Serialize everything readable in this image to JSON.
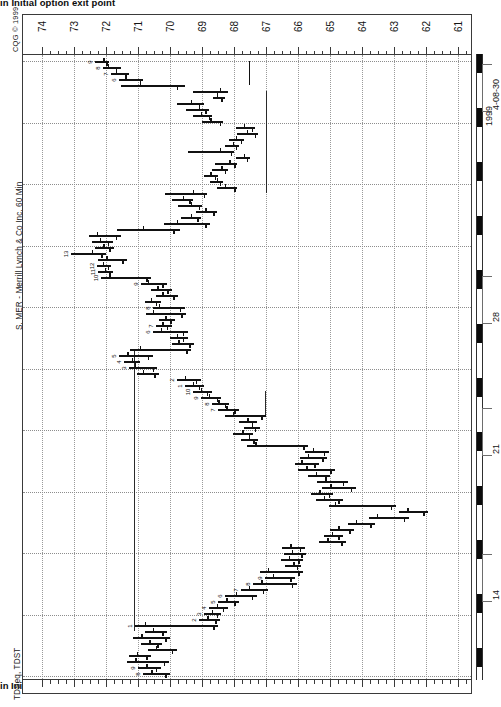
{
  "document": {
    "title_clipped": "in Initial option exit point",
    "title_clipped_bottom": "in Initial option exit point"
  },
  "chart_meta": {
    "copyright": "CQG © 1999",
    "symbol_caption": "S, MER - Merrill Lynch & Co Inc, 60 Min",
    "study_caption": "TDSeq, TDST",
    "vendor": "CQG",
    "interval": "60 Min",
    "symbol": "MER",
    "company": "Merrill Lynch & Co Inc",
    "orientation": "rotated-90-clockwise",
    "ink_color": "#111111",
    "grid_color": "#8d8d8d",
    "frame_color": "#3a3a3a"
  },
  "chart_data": {
    "type": "bar",
    "subtype": "ohlc-bar-rotated",
    "title": "S, MER - Merrill Lynch & Co Inc, 60 Min",
    "xlabel": "Price",
    "ylabel": "Time",
    "grid": true,
    "legend": "none",
    "price_axis": {
      "orientation": "horizontal-top",
      "direction": "descending-left-to-right",
      "ticks": [
        74,
        73,
        72,
        71,
        70,
        69,
        68,
        67,
        66,
        65,
        64,
        63,
        62,
        61
      ],
      "minor_divisions_per_major": 4,
      "xlim": [
        74.6,
        60.6
      ]
    },
    "time_axis": {
      "orientation": "vertical-right",
      "direction": "newest-at-top",
      "end_label": "4-08-30",
      "year_label": "1999",
      "tick_labels": [
        "4-08-30",
        "1999",
        "28",
        "21",
        "14"
      ],
      "session_shading": "alternating-black-white-day-blocks"
    },
    "annotations": {
      "tdst_lines": [
        {
          "name": "tdst-resistance-upper",
          "price": 67.0,
          "label": "TDST"
        },
        {
          "name": "tdst-support-mid",
          "price": 71.1,
          "label": "TDST"
        },
        {
          "name": "tdst-resistance-lower",
          "price": 67.05,
          "label": "TDST"
        }
      ],
      "td_sequential_counts": [
        "9",
        "8",
        "7",
        "6",
        "9",
        "8",
        "7",
        "6",
        "5",
        "4",
        "3",
        "2",
        "1",
        "9",
        "8",
        "7",
        "6",
        "5",
        "4",
        "3",
        "2",
        "1",
        "9",
        "8",
        "7",
        "6"
      ]
    },
    "bars": [
      {
        "t": 0,
        "o": 72.1,
        "h": 72.35,
        "l": 71.9,
        "c": 72.0,
        "num": "9"
      },
      {
        "t": 1,
        "o": 71.95,
        "h": 72.1,
        "l": 71.55,
        "c": 71.7,
        "num": "8"
      },
      {
        "t": 2,
        "o": 71.7,
        "h": 71.85,
        "l": 71.3,
        "c": 71.4,
        "num": "7"
      },
      {
        "t": 3,
        "o": 71.4,
        "h": 71.6,
        "l": 70.85,
        "c": 70.95,
        "num": "6"
      },
      {
        "t": 4,
        "o": 70.95,
        "h": 71.55,
        "l": 69.55,
        "c": 69.8,
        "num": ""
      },
      {
        "t": 5,
        "o": 68.45,
        "h": 69.3,
        "l": 68.2,
        "c": 68.55,
        "num": ""
      },
      {
        "t": 6,
        "o": 68.55,
        "h": 68.65,
        "l": 68.3,
        "c": 68.4,
        "num": ""
      },
      {
        "t": 7,
        "o": 69.35,
        "h": 69.8,
        "l": 68.95,
        "c": 69.1,
        "num": ""
      },
      {
        "t": 8,
        "o": 69.1,
        "h": 69.5,
        "l": 68.8,
        "c": 68.9,
        "num": ""
      },
      {
        "t": 9,
        "o": 69.05,
        "h": 69.3,
        "l": 68.7,
        "c": 68.8,
        "num": ""
      },
      {
        "t": 10,
        "o": 68.75,
        "h": 69.0,
        "l": 68.35,
        "c": 68.45,
        "num": ""
      },
      {
        "t": 11,
        "o": 67.7,
        "h": 67.95,
        "l": 67.35,
        "c": 67.45,
        "num": ""
      },
      {
        "t": 12,
        "o": 67.6,
        "h": 67.9,
        "l": 67.25,
        "c": 67.35,
        "num": ""
      },
      {
        "t": 13,
        "o": 67.95,
        "h": 68.15,
        "l": 67.7,
        "c": 67.8,
        "num": ""
      },
      {
        "t": 14,
        "o": 68.05,
        "h": 68.3,
        "l": 67.85,
        "c": 67.95,
        "num": ""
      },
      {
        "t": 15,
        "o": 68.45,
        "h": 69.45,
        "l": 68.0,
        "c": 68.1,
        "num": ""
      },
      {
        "t": 16,
        "o": 67.7,
        "h": 67.95,
        "l": 67.5,
        "c": 67.6,
        "num": ""
      },
      {
        "t": 17,
        "o": 68.15,
        "h": 68.6,
        "l": 67.9,
        "c": 68.0,
        "num": ""
      },
      {
        "t": 18,
        "o": 68.4,
        "h": 68.7,
        "l": 68.2,
        "c": 68.3,
        "num": ""
      },
      {
        "t": 19,
        "o": 68.75,
        "h": 68.95,
        "l": 68.5,
        "c": 68.6,
        "num": ""
      },
      {
        "t": 20,
        "o": 68.55,
        "h": 68.75,
        "l": 68.35,
        "c": 68.45,
        "num": ""
      },
      {
        "t": 21,
        "o": 68.3,
        "h": 68.55,
        "l": 67.9,
        "c": 68.0,
        "num": ""
      },
      {
        "t": 22,
        "o": 69.3,
        "h": 70.15,
        "l": 68.85,
        "c": 68.95,
        "num": ""
      },
      {
        "t": 23,
        "o": 69.6,
        "h": 69.95,
        "l": 69.3,
        "c": 69.4,
        "num": ""
      },
      {
        "t": 24,
        "o": 69.35,
        "h": 69.75,
        "l": 69.0,
        "c": 69.1,
        "num": ""
      },
      {
        "t": 25,
        "o": 68.9,
        "h": 69.2,
        "l": 68.55,
        "c": 68.65,
        "num": ""
      },
      {
        "t": 26,
        "o": 69.35,
        "h": 69.65,
        "l": 69.05,
        "c": 69.15,
        "num": ""
      },
      {
        "t": 27,
        "o": 69.8,
        "h": 70.2,
        "l": 68.75,
        "c": 68.9,
        "num": ""
      },
      {
        "t": 28,
        "o": 70.85,
        "h": 71.65,
        "l": 69.7,
        "c": 69.9,
        "num": ""
      },
      {
        "t": 29,
        "o": 72.3,
        "h": 72.55,
        "l": 71.55,
        "c": 71.7,
        "num": ""
      },
      {
        "t": 30,
        "o": 72.2,
        "h": 72.45,
        "l": 71.8,
        "c": 71.95,
        "num": ""
      },
      {
        "t": 31,
        "o": 72.1,
        "h": 72.35,
        "l": 71.75,
        "c": 71.9,
        "num": ""
      },
      {
        "t": 32,
        "o": 72.45,
        "h": 73.1,
        "l": 72.0,
        "c": 72.15,
        "num": "13"
      },
      {
        "t": 33,
        "o": 72.0,
        "h": 72.25,
        "l": 71.35,
        "c": 71.5,
        "num": ""
      },
      {
        "t": 34,
        "o": 72.1,
        "h": 72.3,
        "l": 71.85,
        "c": 71.95,
        "num": "12"
      },
      {
        "t": 35,
        "o": 72.05,
        "h": 72.25,
        "l": 71.8,
        "c": 71.9,
        "num": "11"
      },
      {
        "t": 36,
        "o": 71.9,
        "h": 72.15,
        "l": 70.6,
        "c": 70.75,
        "num": "10"
      },
      {
        "t": 37,
        "o": 70.7,
        "h": 70.9,
        "l": 70.1,
        "c": 70.25,
        "num": "9"
      },
      {
        "t": 38,
        "o": 70.4,
        "h": 70.6,
        "l": 69.95,
        "c": 70.1,
        "num": ""
      },
      {
        "t": 39,
        "o": 70.25,
        "h": 70.45,
        "l": 69.75,
        "c": 69.9,
        "num": ""
      },
      {
        "t": 40,
        "o": 70.6,
        "h": 70.8,
        "l": 70.3,
        "c": 70.45,
        "num": ""
      },
      {
        "t": 41,
        "o": 70.35,
        "h": 70.55,
        "l": 69.55,
        "c": 69.7,
        "num": "8"
      },
      {
        "t": 42,
        "o": 70.55,
        "h": 70.75,
        "l": 69.5,
        "c": 69.65,
        "num": ""
      },
      {
        "t": 43,
        "o": 70.15,
        "h": 70.35,
        "l": 69.85,
        "c": 70.0,
        "num": ""
      },
      {
        "t": 44,
        "o": 70.25,
        "h": 70.45,
        "l": 69.95,
        "c": 70.1,
        "num": "7"
      },
      {
        "t": 45,
        "o": 70.3,
        "h": 70.55,
        "l": 69.45,
        "c": 69.6,
        "num": "6"
      },
      {
        "t": 46,
        "o": 69.8,
        "h": 70.0,
        "l": 69.45,
        "c": 69.6,
        "num": ""
      },
      {
        "t": 47,
        "o": 69.75,
        "h": 69.95,
        "l": 69.25,
        "c": 69.4,
        "num": ""
      },
      {
        "t": 48,
        "o": 70.95,
        "h": 71.25,
        "l": 69.35,
        "c": 69.5,
        "num": ""
      },
      {
        "t": 49,
        "o": 71.35,
        "h": 71.6,
        "l": 70.55,
        "c": 70.7,
        "num": "5"
      },
      {
        "t": 50,
        "o": 71.2,
        "h": 71.45,
        "l": 70.95,
        "c": 71.1,
        "num": "4"
      },
      {
        "t": 51,
        "o": 71.1,
        "h": 71.3,
        "l": 70.4,
        "c": 70.55,
        "num": "3"
      },
      {
        "t": 52,
        "o": 70.85,
        "h": 71.05,
        "l": 70.35,
        "c": 70.5,
        "num": ""
      },
      {
        "t": 53,
        "o": 69.55,
        "h": 69.8,
        "l": 69.05,
        "c": 69.2,
        "num": "2"
      },
      {
        "t": 54,
        "o": 69.3,
        "h": 69.55,
        "l": 68.95,
        "c": 69.1,
        "num": "1"
      },
      {
        "t": 55,
        "o": 69.05,
        "h": 69.3,
        "l": 68.7,
        "c": 68.85,
        "num": "10"
      },
      {
        "t": 56,
        "o": 68.8,
        "h": 69.05,
        "l": 68.4,
        "c": 68.55,
        "num": "9"
      },
      {
        "t": 57,
        "o": 68.5,
        "h": 68.7,
        "l": 68.15,
        "c": 68.3,
        "num": "8"
      },
      {
        "t": 58,
        "o": 68.25,
        "h": 68.5,
        "l": 67.85,
        "c": 68.0,
        "num": "7"
      },
      {
        "t": 59,
        "o": 68.05,
        "h": 68.3,
        "l": 67.0,
        "c": 67.15,
        "num": ""
      },
      {
        "t": 60,
        "o": 67.6,
        "h": 67.85,
        "l": 67.3,
        "c": 67.45,
        "num": ""
      },
      {
        "t": 61,
        "o": 67.45,
        "h": 67.7,
        "l": 67.2,
        "c": 67.35,
        "num": ""
      },
      {
        "t": 62,
        "o": 67.75,
        "h": 68.05,
        "l": 67.4,
        "c": 67.55,
        "num": ""
      },
      {
        "t": 63,
        "o": 67.55,
        "h": 67.8,
        "l": 67.25,
        "c": 67.4,
        "num": ""
      },
      {
        "t": 64,
        "o": 67.35,
        "h": 67.6,
        "l": 65.7,
        "c": 65.85,
        "num": ""
      },
      {
        "t": 65,
        "o": 65.55,
        "h": 65.8,
        "l": 65.05,
        "c": 65.2,
        "num": ""
      },
      {
        "t": 66,
        "o": 65.7,
        "h": 65.95,
        "l": 65.1,
        "c": 65.25,
        "num": ""
      },
      {
        "t": 67,
        "o": 65.9,
        "h": 66.1,
        "l": 65.35,
        "c": 65.5,
        "num": ""
      },
      {
        "t": 68,
        "o": 65.75,
        "h": 66.0,
        "l": 64.85,
        "c": 65.0,
        "num": ""
      },
      {
        "t": 69,
        "o": 65.45,
        "h": 65.7,
        "l": 65.0,
        "c": 65.15,
        "num": ""
      },
      {
        "t": 70,
        "o": 65.15,
        "h": 65.4,
        "l": 64.45,
        "c": 64.6,
        "num": ""
      },
      {
        "t": 71,
        "o": 65.0,
        "h": 65.25,
        "l": 64.2,
        "c": 64.35,
        "num": ""
      },
      {
        "t": 72,
        "o": 65.35,
        "h": 65.6,
        "l": 64.9,
        "c": 65.05,
        "num": ""
      },
      {
        "t": 73,
        "o": 65.2,
        "h": 65.45,
        "l": 64.6,
        "c": 64.75,
        "num": ""
      },
      {
        "t": 74,
        "o": 64.85,
        "h": 65.05,
        "l": 62.95,
        "c": 63.1,
        "num": ""
      },
      {
        "t": 75,
        "o": 62.6,
        "h": 62.85,
        "l": 61.95,
        "c": 62.1,
        "num": ""
      },
      {
        "t": 76,
        "o": 63.55,
        "h": 63.8,
        "l": 62.55,
        "c": 62.7,
        "num": ""
      },
      {
        "t": 77,
        "o": 64.2,
        "h": 64.45,
        "l": 63.6,
        "c": 63.75,
        "num": ""
      },
      {
        "t": 78,
        "o": 64.75,
        "h": 65.0,
        "l": 64.25,
        "c": 64.4,
        "num": ""
      },
      {
        "t": 79,
        "o": 64.95,
        "h": 65.2,
        "l": 64.6,
        "c": 64.75,
        "num": ""
      },
      {
        "t": 80,
        "o": 65.1,
        "h": 65.35,
        "l": 64.5,
        "c": 64.65,
        "num": ""
      },
      {
        "t": 81,
        "o": 66.25,
        "h": 66.5,
        "l": 65.8,
        "c": 65.95,
        "num": ""
      },
      {
        "t": 82,
        "o": 66.2,
        "h": 66.45,
        "l": 65.75,
        "c": 65.9,
        "num": ""
      },
      {
        "t": 83,
        "o": 66.3,
        "h": 66.55,
        "l": 65.85,
        "c": 66.0,
        "num": ""
      },
      {
        "t": 84,
        "o": 66.15,
        "h": 66.4,
        "l": 65.9,
        "c": 66.05,
        "num": ""
      },
      {
        "t": 85,
        "o": 66.95,
        "h": 67.2,
        "l": 65.85,
        "c": 66.0,
        "num": ""
      },
      {
        "t": 86,
        "o": 66.8,
        "h": 67.05,
        "l": 66.1,
        "c": 66.25,
        "num": "9"
      },
      {
        "t": 87,
        "o": 67.15,
        "h": 67.4,
        "l": 66.05,
        "c": 66.2,
        "num": "8"
      },
      {
        "t": 88,
        "o": 67.55,
        "h": 67.8,
        "l": 66.95,
        "c": 67.1,
        "num": "7"
      },
      {
        "t": 89,
        "o": 67.95,
        "h": 68.3,
        "l": 67.3,
        "c": 67.45,
        "num": "6"
      },
      {
        "t": 90,
        "o": 68.25,
        "h": 68.5,
        "l": 67.85,
        "c": 68.0,
        "num": "5"
      },
      {
        "t": 91,
        "o": 68.55,
        "h": 68.8,
        "l": 68.2,
        "c": 68.35,
        "num": "4"
      },
      {
        "t": 92,
        "o": 68.7,
        "h": 68.95,
        "l": 68.4,
        "c": 68.55,
        "num": "3"
      },
      {
        "t": 93,
        "o": 68.85,
        "h": 69.1,
        "l": 68.45,
        "c": 68.6,
        "num": "2"
      },
      {
        "t": 94,
        "o": 70.8,
        "h": 71.1,
        "l": 68.5,
        "c": 68.65,
        "num": "1"
      },
      {
        "t": 95,
        "o": 70.55,
        "h": 70.8,
        "l": 70.1,
        "c": 70.25,
        "num": ""
      },
      {
        "t": 96,
        "o": 70.9,
        "h": 71.15,
        "l": 70.0,
        "c": 70.15,
        "num": ""
      },
      {
        "t": 97,
        "o": 70.65,
        "h": 70.9,
        "l": 70.25,
        "c": 70.4,
        "num": ""
      },
      {
        "t": 98,
        "o": 70.45,
        "h": 70.7,
        "l": 69.8,
        "c": 69.95,
        "num": ""
      },
      {
        "t": 99,
        "o": 71.05,
        "h": 71.3,
        "l": 70.6,
        "c": 70.75,
        "num": ""
      },
      {
        "t": 100,
        "o": 71.1,
        "h": 71.35,
        "l": 70.05,
        "c": 70.2,
        "num": ""
      },
      {
        "t": 101,
        "o": 70.75,
        "h": 71.0,
        "l": 70.3,
        "c": 70.45,
        "num": "9"
      },
      {
        "t": 102,
        "o": 70.6,
        "h": 70.85,
        "l": 70.0,
        "c": 70.15,
        "num": "8"
      }
    ]
  }
}
